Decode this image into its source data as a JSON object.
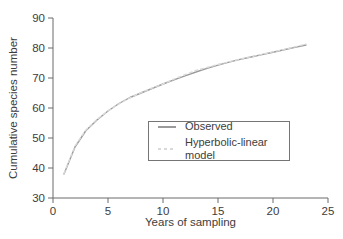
{
  "figure": {
    "background": "#ffffff",
    "axis_color": "#6b6b6b",
    "text_color": "#3d3d3d"
  },
  "chart_data": {
    "type": "line",
    "title": "",
    "xlabel": "Years of sampling",
    "ylabel": "Cumulative species number",
    "xlim": [
      0,
      25
    ],
    "ylim": [
      30,
      90
    ],
    "xticks": [
      0,
      5,
      10,
      15,
      20,
      25
    ],
    "yticks": [
      30,
      40,
      50,
      60,
      70,
      80,
      90
    ],
    "grid": false,
    "legend_position": "inside-lower-right",
    "x": [
      1,
      2,
      3,
      4,
      5,
      6,
      7,
      8,
      9,
      10,
      11,
      12,
      13,
      14,
      15,
      16,
      17,
      18,
      19,
      20,
      21,
      22,
      23
    ],
    "series": [
      {
        "name": "Observed",
        "style": "solid",
        "color": "#9a9a9a",
        "values": [
          38,
          47,
          52.5,
          56,
          59,
          61.5,
          63.5,
          65,
          66.5,
          68,
          69.4,
          70.7,
          72,
          73.2,
          74.3,
          75.3,
          76.2,
          77,
          77.8,
          78.6,
          79.4,
          80.2,
          81
        ]
      },
      {
        "name": "Hyperbolic-linear model",
        "style": "dotted",
        "color": "#d9d9d9",
        "values": [
          38.2,
          47.3,
          52.7,
          56.2,
          59,
          61.4,
          63.4,
          65.1,
          66.6,
          68,
          69.6,
          71.1,
          72.5,
          73.5,
          74.5,
          75.4,
          76.3,
          77.1,
          77.9,
          78.7,
          79.5,
          80.4,
          81.3
        ]
      }
    ]
  }
}
